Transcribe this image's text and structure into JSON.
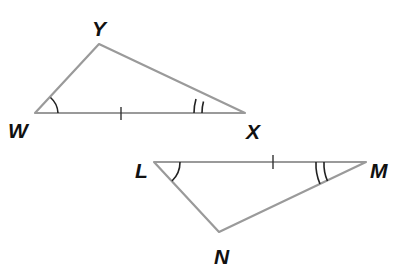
{
  "diagram": {
    "type": "congruent-triangles",
    "colors": {
      "side": "#9a9a9a",
      "mark": "#222222",
      "label": "#111111",
      "background": "#ffffff"
    },
    "triangles": [
      {
        "name": "WXY",
        "vertices": {
          "W": {
            "label": "W",
            "x": 35,
            "y": 113
          },
          "X": {
            "label": "X",
            "x": 245,
            "y": 113
          },
          "Y": {
            "label": "Y",
            "x": 99,
            "y": 44
          }
        },
        "marks": {
          "side_tick": {
            "side": "WX",
            "count": 1
          },
          "angle_W": {
            "arcs": 1
          },
          "angle_X": {
            "arcs": 2
          }
        }
      },
      {
        "name": "LMN",
        "vertices": {
          "L": {
            "label": "L",
            "x": 154,
            "y": 162
          },
          "M": {
            "label": "M",
            "x": 366,
            "y": 162
          },
          "N": {
            "label": "N",
            "x": 219,
            "y": 232
          }
        },
        "marks": {
          "side_tick": {
            "side": "LM",
            "count": 1
          },
          "angle_L": {
            "arcs": 1
          },
          "angle_M": {
            "arcs": 2
          }
        }
      }
    ],
    "labels": {
      "Y": "Y",
      "W": "W",
      "X": "X",
      "L": "L",
      "M": "M",
      "N": "N"
    }
  }
}
